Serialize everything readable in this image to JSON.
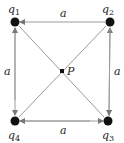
{
  "diagram": {
    "type": "square-charge-configuration",
    "charges": [
      {
        "id": "q1",
        "label": "q",
        "sub": "1",
        "x": 15,
        "y": 22,
        "lx": 8,
        "ly": 12
      },
      {
        "id": "q2",
        "label": "q",
        "sub": "2",
        "x": 110,
        "y": 22,
        "lx": 101,
        "ly": 12
      },
      {
        "id": "q3",
        "label": "q",
        "sub": "3",
        "x": 108,
        "y": 121,
        "lx": 101,
        "ly": 138
      },
      {
        "id": "q4",
        "label": "q",
        "sub": "4",
        "x": 15,
        "y": 121,
        "lx": 8,
        "ly": 138
      }
    ],
    "center_point": {
      "label": "P",
      "x": 62,
      "y": 71
    },
    "side_labels": {
      "top": "a",
      "bottom": "a",
      "left": "a",
      "right": "a"
    },
    "colors": {
      "line": "#9a9a9a",
      "charge": "#111111",
      "text": "#222222"
    }
  }
}
